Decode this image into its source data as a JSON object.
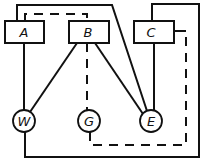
{
  "diagram": {
    "type": "wiring-diagram",
    "boxes": [
      {
        "id": "A",
        "label": "A"
      },
      {
        "id": "B",
        "label": "B"
      },
      {
        "id": "C",
        "label": "C"
      }
    ],
    "nodes": [
      {
        "id": "W",
        "label": "W"
      },
      {
        "id": "G",
        "label": "G"
      },
      {
        "id": "E",
        "label": "E"
      }
    ],
    "connections": [
      {
        "from": "A",
        "to": "W",
        "style": "solid"
      },
      {
        "from": "A",
        "to": "E",
        "style": "solid"
      },
      {
        "from": "B",
        "to": "W",
        "style": "solid"
      },
      {
        "from": "B",
        "to": "E",
        "style": "solid"
      },
      {
        "from": "C",
        "to": "E",
        "style": "solid"
      },
      {
        "from": "C",
        "to": "W",
        "style": "solid"
      },
      {
        "from": "A",
        "to": "G",
        "style": "dashed"
      },
      {
        "from": "G",
        "to": "C",
        "style": "dashed"
      }
    ]
  }
}
